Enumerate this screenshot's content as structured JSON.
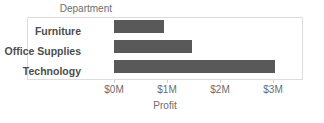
{
  "chart_data": {
    "type": "bar",
    "orientation": "horizontal",
    "title": "",
    "subtitle": "",
    "xlabel": "Profit",
    "ylabel": "Department",
    "categories": [
      "Furniture",
      "Office Supplies",
      "Technology"
    ],
    "values": [
      0.95,
      1.47,
      3.04
    ],
    "value_unit": "$M",
    "xlim": [
      0,
      3.5
    ],
    "x_ticks": [
      0,
      1,
      2,
      3
    ],
    "x_tick_labels": [
      "$0M",
      "$1M",
      "$2M",
      "$3M"
    ],
    "grid": false,
    "legend": null,
    "series": [
      {
        "name": "Profit",
        "color": "#595959",
        "values": [
          0.95,
          1.47,
          3.04
        ]
      }
    ]
  },
  "header": {
    "field_label": "Department"
  },
  "axis": {
    "x_title": "Profit"
  },
  "rows": [
    {
      "label": "Furniture",
      "value": 0.95
    },
    {
      "label": "Office Supplies",
      "value": 1.47
    },
    {
      "label": "Technology",
      "value": 3.04
    }
  ],
  "colors": {
    "bar": "#595959",
    "frame": "#dcdcdc",
    "text": "#6d6d6d",
    "label_text": "#4d4d4d",
    "background": "#ffffff"
  }
}
